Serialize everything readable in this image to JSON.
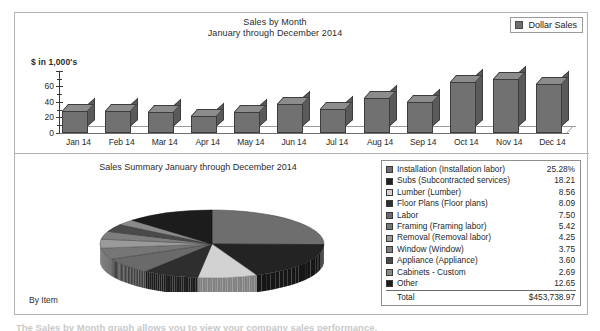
{
  "bar_chart": {
    "title_line1": "Sales by Month",
    "title_line2": "January through December 2014",
    "axis_unit": "$ in 1,000's",
    "legend_label": "Dollar Sales",
    "legend_swatch_color": "#6e6e6e"
  },
  "pie_chart": {
    "title_line1": "Sales Summary",
    "title_line2": "January through December 2014",
    "footer_label": "By Item"
  },
  "legend_table": {
    "total_label": "Total",
    "total_value": "$453,738.97",
    "rows": [
      {
        "label": "Installation (Installation labor)",
        "value": "25.28%",
        "color": "#6e6e6e"
      },
      {
        "label": "Subs (Subcontracted services)",
        "value": "18.21",
        "color": "#232323"
      },
      {
        "label": "Lumber (Lumber)",
        "value": "8.56",
        "color": "#d2d2d2"
      },
      {
        "label": "Floor Plans (Floor plans)",
        "value": "8.09",
        "color": "#2e2e2e"
      },
      {
        "label": "Labor",
        "value": "7.50",
        "color": "#6a6a6a"
      },
      {
        "label": "Framing (Framing labor)",
        "value": "5.42",
        "color": "#767676"
      },
      {
        "label": "Removal (Removal labor)",
        "value": "4.25",
        "color": "#9a9a9a"
      },
      {
        "label": "Window (Window)",
        "value": "3.75",
        "color": "#7e7e7e"
      },
      {
        "label": "Appliance (Appliance)",
        "value": "3.60",
        "color": "#4a4a4a"
      },
      {
        "label": "Cabinets - Custom",
        "value": "2.69",
        "color": "#8a8a8a"
      },
      {
        "label": "Other",
        "value": "12.65",
        "color": "#1c1c1c"
      }
    ]
  },
  "bottom_caption": {
    "text": "The Sales by Month graph allows you to view your company sales performance."
  },
  "chart_data": [
    {
      "type": "bar",
      "title": "Sales by Month — January through December 2014",
      "xlabel": "",
      "ylabel": "$ in 1,000's",
      "categories": [
        "Jan 14",
        "Feb 14",
        "Mar 14",
        "Apr 14",
        "May 14",
        "Jun 14",
        "Jul 14",
        "Aug 14",
        "Sep 14",
        "Oct 14",
        "Nov 14",
        "Dec 14"
      ],
      "series": [
        {
          "name": "Dollar Sales",
          "values": [
            25,
            25,
            24,
            19,
            24,
            33,
            27,
            39,
            35,
            58,
            61,
            55
          ]
        }
      ],
      "yticks": [
        0,
        20,
        40,
        60
      ],
      "ylim": [
        0,
        70
      ],
      "grid": false,
      "legend_position": "top-right"
    },
    {
      "type": "pie",
      "title": "Sales Summary — January through December 2014",
      "labels": [
        "Installation (Installation labor)",
        "Subs (Subcontracted services)",
        "Lumber (Lumber)",
        "Floor Plans (Floor plans)",
        "Labor",
        "Framing (Framing labor)",
        "Removal (Removal labor)",
        "Window (Window)",
        "Appliance (Appliance)",
        "Cabinets - Custom",
        "Other"
      ],
      "values": [
        25.28,
        18.21,
        8.56,
        8.09,
        7.5,
        5.42,
        4.25,
        3.75,
        3.6,
        2.69,
        12.65
      ],
      "unit": "percent",
      "total": "$453,738.97",
      "legend_position": "right"
    }
  ]
}
